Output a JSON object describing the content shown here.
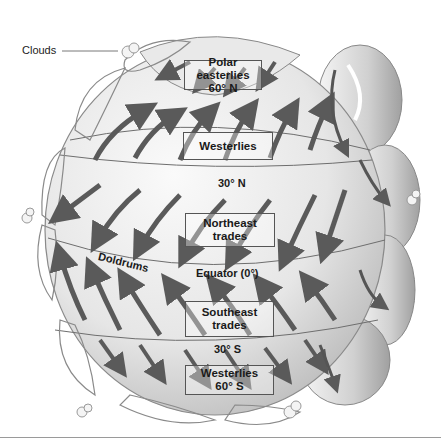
{
  "diagram": {
    "callouts": {
      "clouds": "Clouds"
    },
    "belts": [
      {
        "id": "polar-easterlies-north",
        "line1": "Polar easterlies",
        "line2": "60° N"
      },
      {
        "id": "westerlies-north",
        "line1": "Westerlies",
        "line2": ""
      },
      {
        "id": "northeast-trades",
        "line1": "Northeast",
        "line2": "trades"
      },
      {
        "id": "southeast-trades",
        "line1": "Southeast",
        "line2": "trades"
      },
      {
        "id": "westerlies-south",
        "line1": "Westerlies",
        "line2": "60° S"
      }
    ],
    "latitudes": {
      "n30": "30° N",
      "equator": "Equator (0°)",
      "s30": "30° S",
      "doldrums": "Doldrums"
    },
    "colors": {
      "globe_light": "#f2f2f2",
      "globe_mid": "#d6d6d6",
      "globe_dark": "#a8a8a8",
      "arrow_dark": "#5a5a5a",
      "arrow_light": "#9a9a9a",
      "line": "#6e6e6e"
    }
  }
}
